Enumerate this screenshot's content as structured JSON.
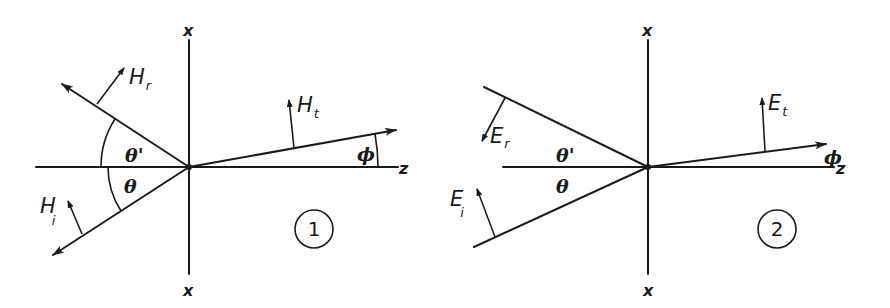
{
  "diagram_1": {
    "number": "1",
    "axis_top": "x",
    "axis_bottom": "x",
    "axis_right": "z",
    "reflected_vector": {
      "base": "H",
      "sub": "r"
    },
    "incident_vector": {
      "base": "H",
      "sub": "i"
    },
    "transmitted_vector": {
      "base": "H",
      "sub": "t"
    },
    "angle_reflected": "θ'",
    "angle_incident": "θ",
    "angle_transmitted": "ϕ"
  },
  "diagram_2": {
    "number": "2",
    "axis_top": "x",
    "axis_bottom": "x",
    "axis_right": "z",
    "reflected_vector": {
      "base": "E",
      "sub": "r"
    },
    "incident_vector": {
      "base": "E",
      "sub": "i"
    },
    "transmitted_vector": {
      "base": "E",
      "sub": "t"
    },
    "angle_reflected": "θ'",
    "angle_incident": "θ",
    "angle_transmitted": "ϕ"
  }
}
